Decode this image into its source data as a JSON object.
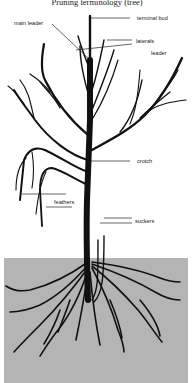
{
  "title": "Pruning terminology (tree)",
  "labels": {
    "main_leader": "main leader",
    "terminal_bud": "terminal bud",
    "laterals": "laterals",
    "leader": "leader",
    "crotch": "crotch",
    "feathers": "feathers",
    "suckers": "suckers"
  },
  "colors": {
    "ground": "#b4b4b4",
    "tree": "#111111",
    "label_line": "#222222"
  }
}
